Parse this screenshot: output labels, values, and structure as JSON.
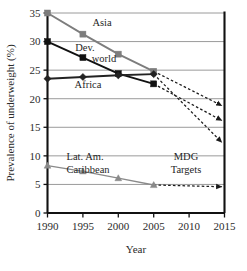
{
  "chart_data": {
    "type": "line",
    "title": "",
    "xlabel": "Year",
    "ylabel": "Prevalence of underweight (%)",
    "xlim": [
      1990,
      2015
    ],
    "ylim": [
      0,
      35
    ],
    "xticks": [
      "1990",
      "1995",
      "2000",
      "2005",
      "2010",
      "2015"
    ],
    "yticks": [
      "0",
      "5",
      "10",
      "15",
      "20",
      "25",
      "30",
      "35"
    ],
    "grid": "horizontal",
    "legend": "inline-labels",
    "x": [
      1990,
      1995,
      2000,
      2005
    ],
    "series": [
      {
        "name": "Asia",
        "label": "Asia",
        "marker": "square",
        "color": "#7d7d7d",
        "values": [
          35.0,
          31.3,
          27.8,
          24.8
        ],
        "projection": {
          "from_year": 2005,
          "from_value": 24.8,
          "to_year": 2014.6,
          "to_value": 18.8,
          "style": "dashed",
          "arrow": true
        }
      },
      {
        "name": "Dev. world",
        "label_line1": "Dev.",
        "label_line2": "world",
        "marker": "square",
        "color": "#111111",
        "values": [
          30.0,
          27.2,
          24.4,
          22.6
        ],
        "projection": {
          "from_year": 2005,
          "from_value": 22.6,
          "to_year": 2014.6,
          "to_value": 16.2,
          "style": "dashed",
          "arrow": true
        }
      },
      {
        "name": "Africa",
        "label": "Africa",
        "marker": "diamond",
        "color": "#222222",
        "values": [
          23.5,
          23.8,
          24.1,
          24.3
        ],
        "projection": {
          "from_year": 2005,
          "from_value": 24.3,
          "to_year": 2014.6,
          "to_value": 12.4,
          "style": "dashed",
          "arrow": true
        }
      },
      {
        "name": "Lat. Am. Caribbean",
        "label_line1": "Lat. Am.",
        "label_line2": "Caribbean",
        "marker": "triangle",
        "color": "#8a8a8a",
        "values": [
          8.3,
          7.3,
          6.1,
          4.9
        ],
        "projection": {
          "from_year": 2005,
          "from_value": 4.9,
          "to_year": 2014.6,
          "to_value": 4.6,
          "style": "dashed",
          "arrow": true
        }
      }
    ],
    "annotations": [
      {
        "name": "mdg-targets",
        "line1": "MDG",
        "line2": "Targets",
        "x": 2011.4,
        "y": 10.6
      }
    ]
  },
  "colors": {
    "axis": "#111111",
    "grid": "#8e8e8e",
    "asia": "#7d7d7d",
    "dev_world": "#111111",
    "africa": "#222222",
    "latam": "#8a8a8a",
    "projection": "#1a1a1a",
    "background": "#ffffff"
  }
}
